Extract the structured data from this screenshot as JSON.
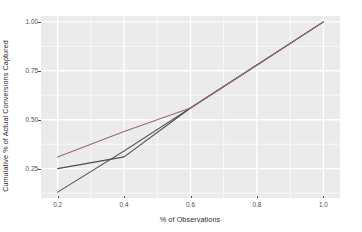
{
  "chart_data": {
    "type": "line",
    "title": "",
    "xlabel": "% of Observations",
    "ylabel": "Cumulative % of Actual Conversions Captured",
    "xlim": [
      0.15,
      1.05
    ],
    "ylim": [
      0.1,
      1.03
    ],
    "grid": true,
    "legend_position": "none",
    "x_ticks": [
      "0.2",
      "0.4",
      "0.6",
      "0.8",
      "1.0"
    ],
    "x_tick_values": [
      0.2,
      0.4,
      0.6,
      0.8,
      1.0
    ],
    "y_ticks": [
      "0.25",
      "0.50",
      "0.75",
      "1.00"
    ],
    "y_tick_values": [
      0.25,
      0.5,
      0.75,
      1.0
    ],
    "series": [
      {
        "name": "baseline",
        "color": "#595959",
        "x": [
          0.2,
          0.4,
          0.6,
          0.8,
          1.0
        ],
        "values": [
          0.13,
          0.34,
          0.56,
          0.78,
          1.0
        ]
      },
      {
        "name": "model-lower",
        "color": "#4d4d4d",
        "x": [
          0.2,
          0.4,
          0.6,
          0.8,
          1.0
        ],
        "values": [
          0.25,
          0.31,
          0.56,
          0.78,
          1.0
        ]
      },
      {
        "name": "model-upper",
        "color": "#9a6a6a",
        "x": [
          0.2,
          0.4,
          0.6,
          0.8,
          1.0
        ],
        "values": [
          0.31,
          0.44,
          0.56,
          0.78,
          1.0
        ]
      }
    ]
  },
  "panel": {
    "background": "#ebebeb",
    "gridline_color": "#ffffff"
  }
}
